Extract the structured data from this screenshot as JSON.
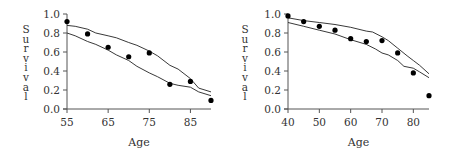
{
  "chart_data": [
    {
      "type": "scatter",
      "title": "",
      "xlabel": "Age",
      "ylabel": "Survival",
      "xlim": [
        55,
        90
      ],
      "ylim": [
        0.0,
        1.0
      ],
      "xticks": [
        55,
        65,
        75,
        85
      ],
      "yticks": [
        0.0,
        0.2,
        0.4,
        0.6,
        0.8,
        1.0
      ],
      "xtick_labels": [
        "55",
        "65",
        "75",
        "85"
      ],
      "ytick_labels": [
        "0.0",
        "0.2",
        "0.4",
        "0.6",
        "0.8",
        "1.0"
      ],
      "grid": false,
      "legend": null,
      "series": [
        {
          "name": "observed",
          "kind": "points",
          "x": [
            55,
            60,
            65,
            70,
            75,
            80,
            85,
            90
          ],
          "y": [
            0.92,
            0.79,
            0.65,
            0.55,
            0.59,
            0.26,
            0.29,
            0.09
          ]
        },
        {
          "name": "upper band",
          "kind": "line",
          "x": [
            55,
            57,
            60,
            62,
            65,
            67,
            70,
            72,
            75,
            77,
            80,
            82,
            85,
            87,
            90
          ],
          "y": [
            0.88,
            0.87,
            0.84,
            0.8,
            0.77,
            0.75,
            0.7,
            0.67,
            0.61,
            0.56,
            0.46,
            0.42,
            0.32,
            0.22,
            0.18
          ]
        },
        {
          "name": "lower band",
          "kind": "line",
          "x": [
            55,
            57,
            60,
            62,
            65,
            67,
            70,
            72,
            75,
            77,
            80,
            82,
            85,
            87,
            90
          ],
          "y": [
            0.8,
            0.77,
            0.71,
            0.68,
            0.62,
            0.57,
            0.51,
            0.45,
            0.38,
            0.34,
            0.27,
            0.25,
            0.23,
            0.18,
            0.14
          ]
        }
      ]
    },
    {
      "type": "scatter",
      "title": "",
      "xlabel": "Age",
      "ylabel": "Survival",
      "xlim": [
        40,
        85
      ],
      "ylim": [
        0.0,
        1.0
      ],
      "xticks": [
        40,
        50,
        60,
        70,
        80
      ],
      "yticks": [
        0.0,
        0.2,
        0.4,
        0.6,
        0.8,
        1.0
      ],
      "xtick_labels": [
        "40",
        "50",
        "60",
        "70",
        "80"
      ],
      "ytick_labels": [
        "0.0",
        "0.2",
        "0.4",
        "0.6",
        "0.8",
        "1.0"
      ],
      "grid": false,
      "legend": null,
      "series": [
        {
          "name": "observed",
          "kind": "points",
          "x": [
            40,
            45,
            50,
            55,
            60,
            65,
            70,
            75,
            80,
            85
          ],
          "y": [
            0.98,
            0.92,
            0.87,
            0.83,
            0.74,
            0.71,
            0.72,
            0.59,
            0.38,
            0.14
          ]
        },
        {
          "name": "upper band",
          "kind": "line",
          "x": [
            40,
            45,
            50,
            55,
            60,
            65,
            67,
            70,
            72,
            75,
            78,
            80,
            82,
            85
          ],
          "y": [
            0.96,
            0.93,
            0.91,
            0.89,
            0.86,
            0.82,
            0.81,
            0.76,
            0.72,
            0.64,
            0.56,
            0.51,
            0.46,
            0.37
          ]
        },
        {
          "name": "lower band",
          "kind": "line",
          "x": [
            40,
            45,
            50,
            55,
            60,
            65,
            68,
            70,
            72,
            75,
            77,
            80,
            82,
            85
          ],
          "y": [
            0.91,
            0.87,
            0.83,
            0.79,
            0.73,
            0.68,
            0.63,
            0.59,
            0.57,
            0.51,
            0.45,
            0.43,
            0.39,
            0.33
          ]
        }
      ]
    }
  ]
}
